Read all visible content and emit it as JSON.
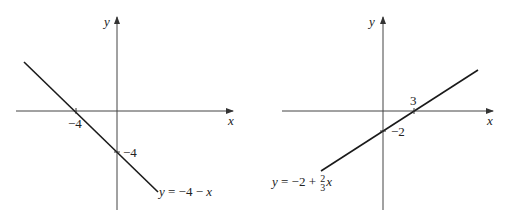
{
  "left_graph": {
    "axis_x_label": "x",
    "axis_y_label": "y",
    "x_intercept_label": "−4",
    "y_intercept_label": "−4",
    "equation": "y = −4 − x",
    "equation_lhs": "y",
    "equation_rhs": " = −4 − ",
    "equation_var": "x"
  },
  "right_graph": {
    "axis_x_label": "x",
    "axis_y_label": "y",
    "x_intercept_label": "3",
    "y_intercept_label": "−2",
    "equation": "y = −2 + (2/3)x",
    "equation_lhs": "y",
    "equation_mid": " = −2 + ",
    "frac_num": "2",
    "frac_den": "3",
    "equation_var": "x"
  },
  "colors": {
    "line": "#1a1a1a",
    "axis": "#333333",
    "background": "#ffffff"
  }
}
